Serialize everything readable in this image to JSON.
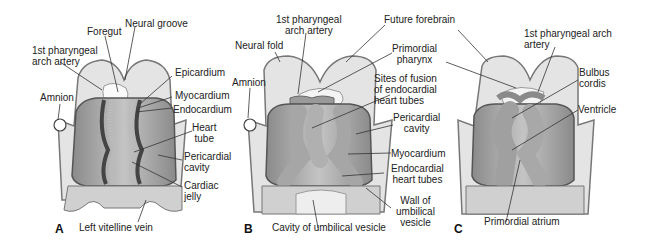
{
  "panels": [
    {
      "letter": "A",
      "labels": {
        "foregut": "Foregut",
        "neural_groove": "Neural groove",
        "pharyngeal_artery": "1st pharyngeal\narch artery",
        "amnion": "Amnion",
        "epicardium": "Epicardium",
        "myocardium": "Myocardium",
        "endocardium": "Endocardium",
        "heart_tube": "Heart\ntube",
        "pericardial_cavity": "Pericardial\ncavity",
        "cardiac_jelly": "Cardiac\njelly",
        "left_vitelline_vein": "Left vitelline vein"
      }
    },
    {
      "letter": "B",
      "labels": {
        "pharyngeal_artery": "1st pharyngeal\narch artery",
        "neural_fold": "Neural fold",
        "amnion": "Amnion",
        "future_forebrain": "Future forebrain",
        "primordial_pharynx": "Primordial\npharynx",
        "sites_of_fusion": "Sites of fusion\nof endocardial\nheart tubes",
        "pericardial_cavity": "Pericardial\ncavity",
        "myocardium": "Myocardium",
        "endocardial_heart_tubes": "Endocardial\nheart tubes",
        "wall_umbilical_vesicle": "Wall of\numbilical\nvesicle",
        "cavity_umbilical_vesicle": "Cavity of umbilical vesicle"
      }
    },
    {
      "letter": "C",
      "labels": {
        "pharyngeal_artery": "1st pharyngeal arch\nartery",
        "bulbus_cordis": "Bulbus\ncordis",
        "ventricle": "Ventricle",
        "primordial_atrium": "Primordial atrium"
      }
    }
  ],
  "colors": {
    "tissue_light": "#e4e4e4",
    "tissue_mid": "#b8b8b8",
    "tissue_dark": "#7a7a7a",
    "outline": "#555555",
    "leader": "#333333"
  }
}
